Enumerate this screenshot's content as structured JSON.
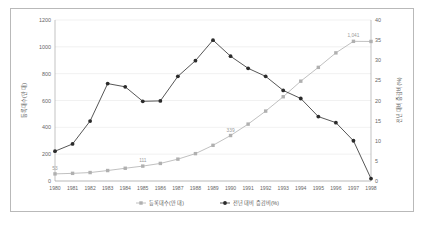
{
  "chart_data": {
    "type": "line",
    "title": "",
    "xlabel": "",
    "categories": [
      "1980",
      "1981",
      "1982",
      "1983",
      "1984",
      "1985",
      "1986",
      "1987",
      "1988",
      "1989",
      "1990",
      "1991",
      "1992",
      "1993",
      "1994",
      "1995",
      "1996",
      "1997",
      "1998"
    ],
    "series": [
      {
        "name": "등록대수(만 대)",
        "axis": "left",
        "color": "#b0b0b0",
        "marker": "square",
        "ylabel": "등록대수(만 대)",
        "ylim": [
          0,
          1200
        ],
        "yticks": [
          0,
          200,
          400,
          600,
          800,
          1000,
          1200
        ],
        "values": [
          53,
          57,
          63,
          78,
          95,
          111,
          131,
          163,
          204,
          266,
          339,
          424,
          521,
          628,
          744,
          847,
          955,
          1041,
          1040
        ],
        "point_labels": {
          "1980": "53",
          "1985": "111",
          "1990": "339",
          "1997": "1,041"
        }
      },
      {
        "name": "전년 대비 증감비(%)",
        "axis": "right",
        "color": "#2b2b2b",
        "marker": "circle",
        "ylabel": "전년 대비 증감비(%)",
        "ylim": [
          0,
          40
        ],
        "yticks": [
          0,
          5,
          10,
          15,
          20,
          25,
          30,
          35,
          40
        ],
        "values": [
          7.4,
          9.2,
          14.9,
          24.2,
          23.4,
          19.8,
          19.9,
          26.0,
          29.9,
          35.0,
          31.0,
          28.0,
          26.0,
          22.5,
          20.5,
          16.0,
          14.5,
          10.0,
          0.6
        ]
      }
    ],
    "legend": {
      "position": "bottom",
      "entries": [
        "등록대수(만 대)",
        "전년 대비 증감비(%)"
      ]
    },
    "grid": {
      "horizontal": true,
      "vertical": false
    }
  },
  "icons": {
    "left_series_marker": "square-marker-icon",
    "right_series_marker": "circle-marker-icon"
  },
  "colors": {
    "frame": "#b9b9b9",
    "grid": "#e2e2e2",
    "axis": "#9a9a9a",
    "series_light": "#b0b0b0",
    "series_dark": "#2b2b2b",
    "background": "#ffffff",
    "text": "#666666"
  }
}
